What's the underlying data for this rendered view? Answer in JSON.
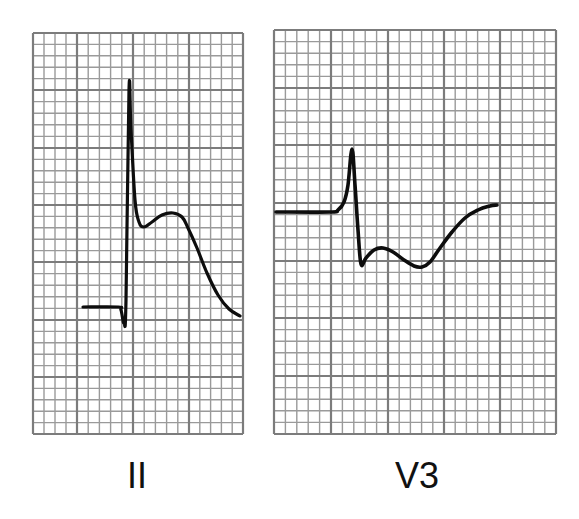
{
  "figure": {
    "colors": {
      "background": "#ffffff",
      "grid_minor": "#9a9a9a",
      "grid_major": "#7c7c7c",
      "trace": "#0d0d0d",
      "label": "#111111"
    },
    "panels": [
      {
        "id": "lead-ii",
        "label": "II",
        "grid": {
          "x": 33,
          "y": 33,
          "width": 210,
          "height": 401,
          "minor_step": 11.2,
          "major_step": 56,
          "major_x": [
            33,
            77,
            133,
            189,
            243
          ],
          "major_y": [
            33,
            90,
            148,
            205,
            262,
            320,
            377,
            434
          ]
        },
        "trace_points": [
          [
            83,
            307
          ],
          [
            118,
            307
          ],
          [
            121,
            310
          ],
          [
            124,
            323
          ],
          [
            126,
            300
          ],
          [
            129,
            90
          ],
          [
            131,
            130
          ],
          [
            135,
            200
          ],
          [
            139,
            222
          ],
          [
            144,
            227
          ],
          [
            152,
            222
          ],
          [
            162,
            215
          ],
          [
            173,
            213
          ],
          [
            182,
            217
          ],
          [
            188,
            228
          ],
          [
            197,
            248
          ],
          [
            207,
            273
          ],
          [
            218,
            295
          ],
          [
            229,
            309
          ],
          [
            240,
            316
          ]
        ],
        "label_x": 97
      },
      {
        "id": "lead-v3",
        "label": "V3",
        "grid": {
          "x": 274,
          "y": 30,
          "width": 282,
          "height": 404,
          "minor_step": 11.2,
          "major_step": 56,
          "major_x": [
            274,
            331,
            388,
            444,
            500,
            556
          ],
          "major_y": [
            30,
            88,
            145,
            203,
            261,
            318,
            376,
            434
          ]
        },
        "trace_points": [
          [
            276,
            212
          ],
          [
            330,
            212
          ],
          [
            338,
            210
          ],
          [
            344,
            202
          ],
          [
            348,
            185
          ],
          [
            352,
            149
          ],
          [
            355,
            185
          ],
          [
            358,
            230
          ],
          [
            361,
            264
          ],
          [
            366,
            258
          ],
          [
            374,
            250
          ],
          [
            383,
            248
          ],
          [
            393,
            252
          ],
          [
            404,
            260
          ],
          [
            414,
            266
          ],
          [
            422,
            267
          ],
          [
            430,
            262
          ],
          [
            440,
            248
          ],
          [
            452,
            232
          ],
          [
            465,
            218
          ],
          [
            478,
            210
          ],
          [
            490,
            206
          ],
          [
            497,
            205
          ]
        ],
        "label_x": 377
      }
    ]
  }
}
